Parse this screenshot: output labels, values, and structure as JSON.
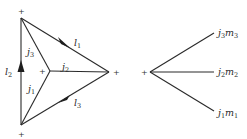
{
  "figure": {
    "left_diagram": {
      "vertices": {
        "top": {
          "x": 21,
          "y": 18,
          "sign": "+"
        },
        "bottom": {
          "x": 21,
          "y": 125,
          "sign": "+"
        },
        "right": {
          "x": 109,
          "y": 72,
          "sign": "+"
        },
        "center": {
          "x": 50,
          "y": 71,
          "sign": "+"
        }
      },
      "outer_edges": [
        {
          "from": "top",
          "to": "right",
          "label": "l",
          "subscript": "1",
          "arrow": "toward right"
        },
        {
          "from": "bottom",
          "to": "top",
          "label": "l",
          "subscript": "2",
          "arrow": "up"
        },
        {
          "from": "right",
          "to": "bottom",
          "label": "l",
          "subscript": "3",
          "arrow": "toward bottom"
        }
      ],
      "inner_edges": [
        {
          "from": "center",
          "to": "top",
          "label": "j",
          "subscript": "3"
        },
        {
          "from": "center",
          "to": "right",
          "label": "j",
          "subscript": "2"
        },
        {
          "from": "center",
          "to": "bottom",
          "label": "j",
          "subscript": "1"
        }
      ]
    },
    "right_diagram": {
      "vertex": {
        "x": 150,
        "y": 72,
        "sign": "+"
      },
      "legs": [
        {
          "label": "j",
          "label_sub": "3",
          "m": "m",
          "m_sub": "3"
        },
        {
          "label": "j",
          "label_sub": "2",
          "m": "m",
          "m_sub": "2"
        },
        {
          "label": "j",
          "label_sub": "1",
          "m": "m",
          "m_sub": "1"
        }
      ]
    },
    "signs": {
      "plus": "+"
    }
  }
}
